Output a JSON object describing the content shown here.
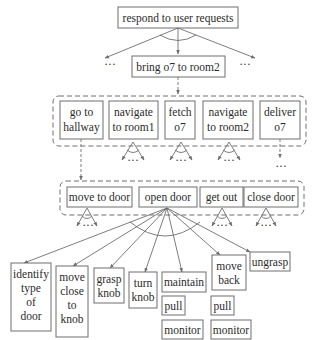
{
  "diagram": {
    "type": "hierarchical task network",
    "colors": {
      "line": "#6e6e6e",
      "text": "#2b2b2b",
      "background": "#ffffff"
    },
    "root": {
      "label": "respond to user requests"
    },
    "ellipsis": "···",
    "task": {
      "label": "bring o7 to room2"
    },
    "level2": {
      "items": [
        {
          "line1": "go to",
          "line2": "hallway"
        },
        {
          "line1": "navigate",
          "line2": "to room1"
        },
        {
          "line1": "fetch",
          "line2": "o7"
        },
        {
          "line1": "navigate",
          "line2": "to room2"
        },
        {
          "line1": "deliver",
          "line2": "o7"
        }
      ]
    },
    "level3": {
      "items": [
        {
          "label": "move to door"
        },
        {
          "label": "open door"
        },
        {
          "label": "get out"
        },
        {
          "label": "close door"
        }
      ]
    },
    "level4": {
      "items": [
        {
          "lines": [
            "identify",
            "type",
            "of",
            "door"
          ]
        },
        {
          "lines": [
            "move",
            "close",
            "to",
            "knob"
          ]
        },
        {
          "lines": [
            "grasp",
            "knob"
          ]
        },
        {
          "lines": [
            "turn",
            "knob"
          ]
        },
        {
          "lines": [
            "maintain"
          ]
        },
        {
          "lines": [
            "move",
            "back"
          ]
        },
        {
          "lines": [
            "ungrasp"
          ]
        }
      ],
      "sub": {
        "maintain": [
          "pull",
          "monitor"
        ],
        "move_back": [
          "pull",
          "monitor"
        ]
      }
    }
  }
}
